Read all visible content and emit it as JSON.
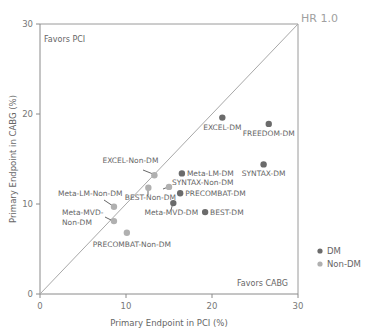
{
  "chart_data": {
    "type": "scatter",
    "title": "",
    "xlabel": "Primary Endpoint in PCI (%)",
    "ylabel": "Primary Endpoint in CABG (%)",
    "xlim": [
      0,
      30
    ],
    "ylim": [
      0,
      30
    ],
    "x_ticks": [
      "0",
      "10",
      "20",
      "30"
    ],
    "y_ticks": [
      "0",
      "10",
      "20",
      "30"
    ],
    "grid": false,
    "reference_line": {
      "label": "HR 1.0",
      "from": [
        0,
        0
      ],
      "to": [
        30,
        30
      ]
    },
    "annotations": {
      "top_left": "Favors PCI",
      "bottom_right": "Favors CABG"
    },
    "legend": {
      "position": "right",
      "entries": [
        {
          "name": "DM",
          "color": "#6b6b6b"
        },
        {
          "name": "Non-DM",
          "color": "#b0b0b0"
        }
      ]
    },
    "series": [
      {
        "name": "DM",
        "color": "#6b6b6b",
        "points": [
          {
            "label": "EXCEL-DM",
            "x": 21.2,
            "y": 19.6
          },
          {
            "label": "FREEDOM-DM",
            "x": 26.6,
            "y": 18.9
          },
          {
            "label": "SYNTAX-DM",
            "x": 26.0,
            "y": 14.4
          },
          {
            "label": "Meta-LM-DM",
            "x": 16.5,
            "y": 13.4
          },
          {
            "label": "PRECOMBAT-DM",
            "x": 16.3,
            "y": 11.2
          },
          {
            "label": "Meta-MVD-DM",
            "x": 15.5,
            "y": 10.1
          },
          {
            "label": "BEST-DM",
            "x": 19.2,
            "y": 9.1
          }
        ]
      },
      {
        "name": "Non-DM",
        "color": "#b0b0b0",
        "points": [
          {
            "label": "EXCEL-Non-DM",
            "x": 13.3,
            "y": 13.2
          },
          {
            "label": "SYNTAX-Non-DM",
            "x": 15.0,
            "y": 11.9
          },
          {
            "label": "BEST-Non-DM",
            "x": 12.6,
            "y": 11.8
          },
          {
            "label": "Meta-LM-Non-DM",
            "x": 8.6,
            "y": 9.7
          },
          {
            "label": "Meta-MVD-Non-DM",
            "x": 8.6,
            "y": 8.1
          },
          {
            "label": "PRECOMBAT-Non-DM",
            "x": 10.1,
            "y": 6.8
          }
        ]
      }
    ]
  }
}
